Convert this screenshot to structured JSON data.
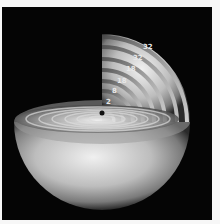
{
  "figure": {
    "background_color": "#050505",
    "frame_color": "#f7f7f7",
    "shell_color": "#bdbdbd",
    "nucleus_label": "•",
    "shell_labels": [
      "2",
      "8",
      "18",
      "18",
      "32",
      "32"
    ]
  }
}
